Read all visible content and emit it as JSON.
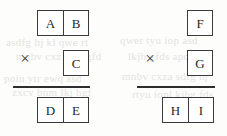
{
  "page": {
    "background_color": "#fdfdfc",
    "ink_color": "#2b2b2b",
    "border_color": "#3a3a3a"
  },
  "problems": [
    {
      "id": "left",
      "multiplicand": {
        "cells": [
          "A",
          "B"
        ]
      },
      "operator": "×",
      "multiplier": {
        "cells": [
          "C"
        ]
      },
      "product": {
        "cells": [
          "D",
          "E"
        ]
      }
    },
    {
      "id": "right",
      "multiplicand": {
        "cells": [
          "F"
        ]
      },
      "operator": "×",
      "multiplier": {
        "cells": [
          "G"
        ]
      },
      "product": {
        "cells": [
          "H",
          "I"
        ]
      }
    }
  ],
  "bleed_text": {
    "line1": "asdfg hj kl qwe rt",
    "line2": "mnbv cxz lkjh gfd",
    "line3": "poiu ytr ewq asd",
    "line4": "zxcv bnm lkj hgf",
    "line5": "qwer tyu iop asd",
    "line6": "lkjh gfds apoi uyt",
    "line7": "mnbv cxza sdfg hj",
    "line8": "rtyu iopl kjhg fds"
  }
}
